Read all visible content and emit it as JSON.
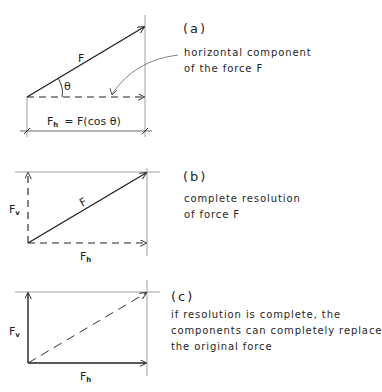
{
  "panels": [
    {
      "id": "a",
      "tag": "(a)",
      "description_lines": [
        "horizontal component",
        "of the force F"
      ],
      "labels": {
        "force": "F",
        "angle": "θ",
        "equation_symbol": "F",
        "equation_subscript": "h",
        "equation_rest": "=  F(cos θ)"
      }
    },
    {
      "id": "b",
      "tag": "(b)",
      "description_lines": [
        "complete resolution",
        "of force F"
      ],
      "labels": {
        "force": "F",
        "vertical_symbol": "F",
        "vertical_subscript": "v",
        "horizontal_symbol": "F",
        "horizontal_subscript": "h"
      }
    },
    {
      "id": "c",
      "tag": "(c)",
      "description_lines": [
        "if resolution is complete, the",
        "components can completely replace",
        "the original force"
      ],
      "labels": {
        "vertical_symbol": "F",
        "vertical_subscript": "v",
        "horizontal_symbol": "F",
        "horizontal_subscript": "h"
      }
    }
  ],
  "colors": {
    "stroke": "#222222",
    "guide": "#8a8a8a",
    "background": "#ffffff"
  }
}
